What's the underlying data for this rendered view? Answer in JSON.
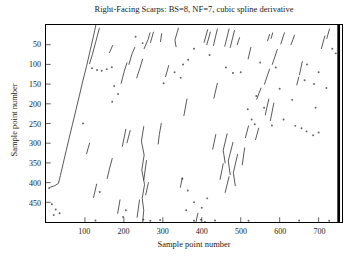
{
  "title": "Right-Facing Scarps: BS=8, NF=7, cubic spline derivative",
  "axes": {
    "xlabel": "Sample point number",
    "ylabel": "Sample point number",
    "x_ticks": [
      100,
      200,
      300,
      400,
      500,
      600,
      700
    ],
    "y_ticks": [
      50,
      100,
      150,
      200,
      250,
      300,
      350,
      400,
      450
    ],
    "x_range": [
      0,
      760
    ],
    "y_range": [
      0,
      500
    ]
  },
  "chart_data": {
    "type": "scatter",
    "title": "Right-Facing Scarps: BS=8, NF=7, cubic spline derivative",
    "xlabel": "Sample point number",
    "ylabel": "Sample point number",
    "xlim": [
      0,
      760
    ],
    "ylim": [
      0,
      500
    ],
    "y_axis_direction": "downward",
    "note": "Sparse black-on-white binary raster of detected right-facing scarp traces: thin, slightly curved diagonal streaks and isolated specks; one long prominent curve descends from (128,0) to (30,400) with a leftward hook; a solid black column runs along the right edge near x=750.",
    "ink_color": "#2f2f2f",
    "right_edge_bar": {
      "x": 748,
      "width": 7,
      "y0": 0,
      "y1": 500
    },
    "segments": [
      [
        128,
        0,
        122,
        28,
        114,
        62,
        104,
        105,
        95,
        140,
        86,
        178,
        77,
        215,
        68,
        252,
        60,
        285,
        52,
        318,
        44,
        352,
        37,
        382,
        32,
        402,
        22,
        408,
        10,
        412
      ],
      [
        137,
        8,
        128,
        42,
        119,
        75,
        112,
        98
      ],
      [
        163,
        70,
        171,
        52
      ],
      [
        193,
        148,
        201,
        117,
        208,
        96
      ],
      [
        213,
        100,
        221,
        73,
        228,
        57
      ],
      [
        233,
        134,
        241,
        110,
        248,
        87
      ],
      [
        205,
        265,
        196,
        308
      ],
      [
        216,
        268,
        208,
        299
      ],
      [
        112,
        300,
        104,
        327
      ],
      [
        170,
        339,
        163,
        365,
        157,
        390
      ],
      [
        130,
        404,
        122,
        438
      ],
      [
        190,
        444,
        184,
        478
      ],
      [
        240,
        444,
        234,
        488
      ],
      [
        258,
        344,
        251,
        394
      ],
      [
        263,
        400,
        256,
        431
      ],
      [
        251,
        258,
        245,
        295,
        252,
        330,
        246,
        368,
        253,
        405,
        247,
        440,
        251,
        470,
        248,
        502
      ],
      [
        296,
        250,
        291,
        278,
        288,
        302
      ],
      [
        252,
        60,
        262,
        37,
        267,
        20
      ],
      [
        294,
        42,
        297,
        22
      ],
      [
        276,
        18,
        268,
        45
      ],
      [
        340,
        8,
        331,
        38,
        334,
        55
      ],
      [
        415,
        12,
        406,
        44
      ],
      [
        422,
        18,
        413,
        50
      ],
      [
        440,
        10,
        430,
        52
      ],
      [
        470,
        10,
        459,
        54
      ],
      [
        484,
        14,
        473,
        57
      ],
      [
        497,
        32,
        491,
        50
      ],
      [
        574,
        24,
        569,
        40
      ],
      [
        582,
        20,
        578,
        34
      ],
      [
        638,
        26,
        629,
        50
      ],
      [
        716,
        28,
        707,
        60
      ],
      [
        728,
        10,
        721,
        34
      ],
      [
        612,
        20,
        603,
        48
      ],
      [
        594,
        62,
        581,
        100
      ],
      [
        574,
        112,
        561,
        150
      ],
      [
        552,
        160,
        541,
        188
      ],
      [
        526,
        57,
        519,
        86
      ],
      [
        658,
        93,
        651,
        126
      ],
      [
        649,
        132,
        644,
        152
      ],
      [
        572,
        188,
        563,
        228
      ],
      [
        585,
        198,
        576,
        243
      ],
      [
        440,
        148,
        431,
        186
      ],
      [
        362,
        188,
        354,
        230
      ],
      [
        315,
        103,
        307,
        131
      ],
      [
        465,
        276,
        455,
        318,
        460,
        350
      ],
      [
        480,
        298,
        468,
        345,
        473,
        380
      ],
      [
        492,
        328,
        481,
        375,
        486,
        408
      ],
      [
        455,
        352,
        447,
        392
      ],
      [
        470,
        385,
        460,
        425
      ],
      [
        436,
        278,
        428,
        315
      ],
      [
        510,
        312,
        504,
        355
      ],
      [
        520,
        256,
        512,
        286
      ],
      [
        546,
        262,
        538,
        291
      ],
      [
        390,
        478,
        385,
        500
      ],
      [
        350,
        388,
        345,
        412
      ]
    ],
    "dots": [
      [
        118,
        110
      ],
      [
        131,
        114
      ],
      [
        143,
        116
      ],
      [
        156,
        112
      ],
      [
        169,
        107
      ],
      [
        330,
        120
      ],
      [
        346,
        134
      ],
      [
        352,
        100
      ],
      [
        365,
        88
      ],
      [
        380,
        60
      ],
      [
        420,
        76
      ],
      [
        462,
        108
      ],
      [
        500,
        120
      ],
      [
        550,
        95
      ],
      [
        590,
        108
      ],
      [
        670,
        100
      ],
      [
        664,
        140
      ],
      [
        700,
        120
      ],
      [
        688,
        150
      ],
      [
        720,
        160
      ],
      [
        735,
        60
      ],
      [
        744,
        72
      ],
      [
        640,
        256
      ],
      [
        656,
        262
      ],
      [
        669,
        270
      ],
      [
        700,
        273
      ],
      [
        686,
        280
      ],
      [
        518,
        214
      ],
      [
        528,
        240
      ],
      [
        536,
        252
      ],
      [
        350,
        390
      ],
      [
        364,
        420
      ],
      [
        380,
        450
      ],
      [
        400,
        464
      ],
      [
        414,
        440
      ],
      [
        360,
        470
      ],
      [
        398,
        494
      ],
      [
        408,
        500
      ],
      [
        138,
        424
      ],
      [
        198,
        487
      ],
      [
        205,
        470
      ],
      [
        250,
        494
      ],
      [
        246,
        504
      ],
      [
        15,
        455
      ],
      [
        25,
        468
      ],
      [
        35,
        478
      ],
      [
        20,
        482
      ],
      [
        8,
        414
      ],
      [
        127,
        496
      ],
      [
        268,
        497
      ],
      [
        293,
        495
      ],
      [
        380,
        497
      ],
      [
        434,
        496
      ],
      [
        520,
        497
      ],
      [
        650,
        496
      ],
      [
        727,
        497
      ],
      [
        230,
        30
      ],
      [
        248,
        46
      ],
      [
        302,
        148
      ],
      [
        480,
        122
      ],
      [
        600,
        162
      ],
      [
        632,
        190
      ],
      [
        692,
        210
      ],
      [
        540,
        180
      ],
      [
        560,
        210
      ],
      [
        610,
        240
      ],
      [
        580,
        255
      ],
      [
        175,
        155
      ],
      [
        185,
        175
      ],
      [
        170,
        195
      ],
      [
        95,
        250
      ]
    ]
  }
}
